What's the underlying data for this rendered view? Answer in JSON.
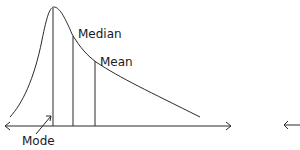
{
  "diagram": {
    "labels": {
      "mode": "Mode",
      "median": "Median",
      "mean": "Mean"
    },
    "colors": {
      "line": "#2a2a2a",
      "text": "#1a1a1a",
      "background": "#ffffff"
    }
  }
}
